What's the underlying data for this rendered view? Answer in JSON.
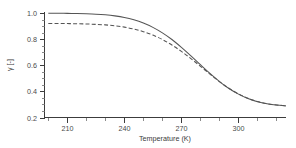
{
  "chart_data": {
    "type": "line",
    "title": "",
    "xlabel": "Temperature (K)",
    "ylabel": "γ [-]",
    "xlim": [
      198,
      325
    ],
    "ylim": [
      0.2,
      1.0
    ],
    "grid": false,
    "legend": "none",
    "xticks": [
      210,
      240,
      270,
      300
    ],
    "xtick_labels": [
      "210",
      "240",
      "270",
      "300"
    ],
    "xminor_step": 10,
    "yticks": [
      0.2,
      0.4,
      0.6,
      0.8,
      1.0
    ],
    "ytick_labels": [
      "0.2",
      "0.4",
      "0.6",
      "0.8",
      "1.0"
    ],
    "yminor_step": 0.05,
    "x": [
      200,
      205,
      210,
      215,
      220,
      225,
      230,
      235,
      240,
      245,
      250,
      255,
      260,
      265,
      270,
      275,
      280,
      285,
      290,
      295,
      300,
      305,
      310,
      315,
      320,
      325
    ],
    "series": [
      {
        "name": "solid-curve",
        "style": "solid",
        "color": "#555555",
        "values": [
          0.998,
          0.998,
          0.997,
          0.996,
          0.994,
          0.991,
          0.986,
          0.978,
          0.966,
          0.948,
          0.923,
          0.89,
          0.848,
          0.797,
          0.737,
          0.672,
          0.604,
          0.537,
          0.475,
          0.422,
          0.379,
          0.345,
          0.321,
          0.305,
          0.295,
          0.289
        ]
      },
      {
        "name": "dashed-curve",
        "style": "dashed",
        "color": "#555555",
        "values": [
          0.92,
          0.92,
          0.919,
          0.918,
          0.916,
          0.913,
          0.909,
          0.902,
          0.892,
          0.877,
          0.857,
          0.831,
          0.797,
          0.755,
          0.706,
          0.651,
          0.592,
          0.532,
          0.475,
          0.424,
          0.381,
          0.347,
          0.322,
          0.306,
          0.296,
          0.29
        ]
      }
    ]
  },
  "figure": {
    "background_color": "#ffffff",
    "axis_color": "#3c3c3c",
    "curve_color": "#555555"
  }
}
